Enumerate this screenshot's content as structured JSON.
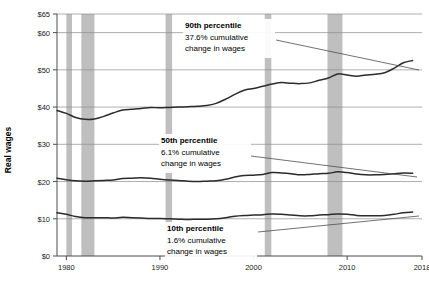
{
  "chart_data": {
    "type": "line",
    "title": "",
    "xlabel": "",
    "ylabel": "Real wages",
    "xlim": [
      1979,
      2018
    ],
    "ylim": [
      0,
      65
    ],
    "grid": true,
    "legend": "annotations-inline",
    "y_ticks": [
      "$0",
      "$10",
      "$20",
      "$30",
      "$40",
      "$50",
      "$60",
      "$65"
    ],
    "y_tick_values": [
      0,
      10,
      20,
      30,
      40,
      50,
      60,
      65
    ],
    "x_ticks": [
      "1980",
      "1990",
      "2000",
      "2010",
      "2018"
    ],
    "x_tick_values": [
      1980,
      1990,
      2000,
      2010,
      2018
    ],
    "recession_bands": [
      {
        "start": 1980.0,
        "end": 1980.6
      },
      {
        "start": 1981.6,
        "end": 1983.0
      },
      {
        "start": 1990.6,
        "end": 1991.3
      },
      {
        "start": 2001.2,
        "end": 2001.9
      },
      {
        "start": 2007.9,
        "end": 2009.5
      }
    ],
    "series": [
      {
        "name": "90th percentile",
        "x": [
          1979,
          1980,
          1981,
          1982,
          1983,
          1984,
          1985,
          1986,
          1987,
          1988,
          1989,
          1990,
          1991,
          1992,
          1993,
          1994,
          1995,
          1996,
          1997,
          1998,
          1999,
          2000,
          2001,
          2002,
          2003,
          2004,
          2005,
          2006,
          2007,
          2008,
          2009,
          2010,
          2011,
          2012,
          2013,
          2014,
          2015,
          2016,
          2017
        ],
        "values": [
          39.1,
          38.3,
          37.2,
          36.7,
          36.8,
          37.5,
          38.4,
          39.2,
          39.4,
          39.6,
          39.9,
          39.8,
          39.9,
          40.0,
          40.1,
          40.2,
          40.4,
          41.0,
          42.1,
          43.4,
          44.5,
          45.0,
          45.6,
          46.2,
          46.6,
          46.4,
          46.3,
          46.5,
          47.2,
          47.8,
          48.9,
          48.6,
          48.3,
          48.6,
          48.8,
          49.2,
          50.4,
          51.9,
          52.5
        ]
      },
      {
        "name": "50th percentile",
        "x": [
          1979,
          1980,
          1981,
          1982,
          1983,
          1984,
          1985,
          1986,
          1987,
          1988,
          1989,
          1990,
          1991,
          1992,
          1993,
          1994,
          1995,
          1996,
          1997,
          1998,
          1999,
          2000,
          2001,
          2002,
          2003,
          2004,
          2005,
          2006,
          2007,
          2008,
          2009,
          2010,
          2011,
          2012,
          2013,
          2014,
          2015,
          2016,
          2017
        ],
        "values": [
          20.9,
          20.5,
          20.2,
          20.1,
          20.2,
          20.3,
          20.4,
          20.8,
          20.9,
          21.0,
          20.9,
          20.6,
          20.4,
          20.3,
          20.1,
          20.0,
          20.1,
          20.2,
          20.6,
          21.2,
          21.6,
          21.7,
          21.9,
          22.4,
          22.3,
          22.1,
          21.8,
          21.9,
          22.1,
          22.2,
          22.6,
          22.4,
          22.0,
          21.8,
          21.8,
          21.9,
          22.1,
          22.3,
          22.2
        ]
      },
      {
        "name": "10th percentile",
        "x": [
          1979,
          1980,
          1981,
          1982,
          1983,
          1984,
          1985,
          1986,
          1987,
          1988,
          1989,
          1990,
          1991,
          1992,
          1993,
          1994,
          1995,
          1996,
          1997,
          1998,
          1999,
          2000,
          2001,
          2002,
          2003,
          2004,
          2005,
          2006,
          2007,
          2008,
          2009,
          2010,
          2011,
          2012,
          2013,
          2014,
          2015,
          2016,
          2017
        ],
        "values": [
          11.6,
          11.2,
          10.6,
          10.3,
          10.3,
          10.3,
          10.2,
          10.4,
          10.3,
          10.2,
          10.1,
          10.1,
          10.0,
          9.9,
          9.8,
          9.9,
          9.9,
          10.0,
          10.3,
          10.7,
          10.9,
          11.0,
          11.1,
          11.3,
          11.2,
          11.0,
          10.8,
          10.8,
          11.0,
          11.1,
          11.3,
          11.2,
          10.9,
          10.8,
          10.8,
          10.9,
          11.2,
          11.6,
          11.8
        ]
      }
    ],
    "annotations": [
      {
        "id": "p90",
        "title": "90th percentile",
        "line1": "37.6% cumulative",
        "line2": "change in wages"
      },
      {
        "id": "p50",
        "title": "50th percentile",
        "line1": "6.1% cumulative",
        "line2": "change in wages"
      },
      {
        "id": "p10",
        "title": "10th percentile",
        "line1": "1.6% cumulative",
        "line2": "change in wages"
      }
    ],
    "colors": {
      "line": "#2b2b2b",
      "grid": "#8c8c8c",
      "axis": "#4d4d4d",
      "recession_band": "#bfbfbf",
      "background": "#ffffff",
      "leader": "#4d4d4d"
    }
  }
}
